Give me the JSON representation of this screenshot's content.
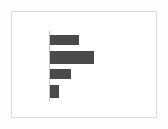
{
  "figure": {
    "background_color": "#fefefe",
    "card_background": "#ffffff",
    "border_color": "#dcdcdc",
    "axis_color": "#c4c4c4",
    "bar_color": "#4a4a4a",
    "width_px": 168,
    "height_px": 129
  },
  "chart_data": {
    "type": "bar",
    "orientation": "horizontal",
    "title": "",
    "subtitle": "",
    "xlabel": "",
    "ylabel": "",
    "categories": [
      "A",
      "B",
      "C",
      "D"
    ],
    "tick_labels": [
      "",
      "",
      "",
      ""
    ],
    "values": [
      29,
      44,
      21,
      9
    ],
    "series": [
      {
        "name": "series-1",
        "color": "#4a4a4a",
        "values": [
          29,
          44,
          21,
          9
        ]
      }
    ],
    "xlim": [
      0,
      50
    ],
    "ylim": [
      0,
      4
    ],
    "grid": false,
    "legend": false,
    "legend_position": "none",
    "annotations": [],
    "bar_geometry": [
      {
        "index": 0,
        "value": 29,
        "length_px": 29,
        "thickness_px": 10,
        "top_px": 23
      },
      {
        "index": 1,
        "value": 44,
        "length_px": 44,
        "thickness_px": 13,
        "top_px": 39
      },
      {
        "index": 2,
        "value": 21,
        "length_px": 21,
        "thickness_px": 10,
        "top_px": 57
      },
      {
        "index": 3,
        "value": 9,
        "length_px": 9,
        "thickness_px": 13,
        "top_px": 73
      }
    ]
  }
}
